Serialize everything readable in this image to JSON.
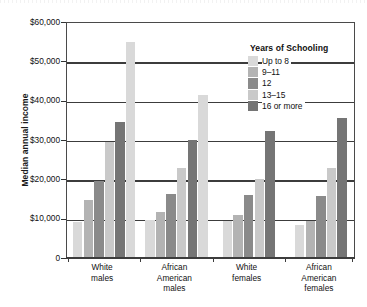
{
  "chart_data": {
    "type": "bar",
    "title": "",
    "xlabel": "",
    "ylabel": "Median annual income",
    "ylim": [
      0,
      60000
    ],
    "ytick_values": [
      60000,
      50000,
      40000,
      30000,
      20000,
      10000,
      0
    ],
    "ytick_labels": [
      "$60,000",
      "$50,000",
      "$40,000",
      "$30,000",
      "$20,000",
      "$10,000",
      "0"
    ],
    "grid": true,
    "legend_position": "upper-right",
    "legend_title": "Years of Schooling",
    "categories": [
      "White males",
      "African American males",
      "White females",
      "African American females"
    ],
    "category_lines": [
      [
        "White",
        "males"
      ],
      [
        "African",
        "American",
        "males"
      ],
      [
        "White",
        "females"
      ],
      [
        "African",
        "American",
        "females"
      ]
    ],
    "series": [
      {
        "name": "Up to 8",
        "color": "#d9d9d9",
        "values": [
          9200,
          9700,
          9300,
          8500
        ]
      },
      {
        "name": "9–11",
        "color": "#b3b3b3",
        "values": [
          14700,
          11800,
          11000,
          9400
        ]
      },
      {
        "name": "12",
        "color": "#8a8a8a",
        "values": [
          19500,
          16200,
          16100,
          15800
        ]
      },
      {
        "name": "13–15",
        "color": "#c9c9c9",
        "values": [
          29400,
          22800,
          20100,
          22800
        ]
      },
      {
        "name": "16 or more",
        "color": "#757575",
        "values": [
          34500,
          30000,
          20100,
          22900
        ]
      }
    ],
    "series_full": [
      {
        "name": "Up to 8",
        "color": "#d9d9d9",
        "values": [
          9200,
          9700,
          9300,
          8500
        ]
      },
      {
        "name": "9–11",
        "color": "#b3b3b3",
        "values": [
          14700,
          11800,
          11000,
          9400
        ]
      },
      {
        "name": "12",
        "color": "#8a8a8a",
        "values": [
          19500,
          16200,
          16100,
          15800
        ]
      },
      {
        "name": "13–15",
        "color": "#c9c9c9",
        "values": [
          29400,
          22800,
          20100,
          22800
        ]
      },
      {
        "name": "16 or more",
        "color": "#757575",
        "values": [
          34500,
          30000,
          20100,
          22900
        ]
      }
    ],
    "bars": [
      {
        "category": "White males",
        "values": [
          {
            "series": "Up to 8",
            "value": 9200
          },
          {
            "series": "9–11",
            "value": 14700
          },
          {
            "series": "12",
            "value": 19500
          },
          {
            "series": "13–15",
            "value": 29400
          },
          {
            "series": "16 or more",
            "value": 34500
          }
        ]
      }
    ]
  },
  "plot": {
    "series_names": [
      "Up to 8",
      "9–11",
      "12",
      "13–15",
      "16 or more"
    ],
    "series_colors": [
      "#d9d9d9",
      "#b3b3b3",
      "#8a8a8a",
      "#c9c9c9",
      "#757575"
    ],
    "groups": [
      {
        "label_lines": [
          "White",
          "males"
        ],
        "values": [
          9200,
          14700,
          19500,
          29400,
          34500,
          55000
        ]
      },
      {
        "label_lines": [
          "African",
          "American",
          "males"
        ],
        "values": [
          9700,
          11800,
          16200,
          22800,
          30000,
          41500
        ]
      },
      {
        "label_lines": [
          "White",
          "females"
        ],
        "values": [
          9300,
          11000,
          16100,
          20100,
          32200
        ]
      },
      {
        "label_lines": [
          "African",
          "American",
          "females"
        ],
        "values": [
          8500,
          9400,
          15800,
          22800,
          35500
        ]
      }
    ]
  },
  "axis": {
    "y_title": "Median annual income",
    "y_ticks": [
      "$60,000",
      "$50,000",
      "$40,000",
      "$30,000",
      "$20,000",
      "$10,000",
      "0"
    ]
  },
  "legend": {
    "title": "Years of Schooling",
    "items": [
      {
        "label": "Up to 8",
        "color": "#d9d9d9"
      },
      {
        "label": "9–11",
        "color": "#b3b3b3"
      },
      {
        "label": "12",
        "color": "#8a8a8a"
      },
      {
        "label": "13–15",
        "color": "#c9c9c9"
      },
      {
        "label": "16 or more",
        "color": "#757575"
      }
    ]
  }
}
